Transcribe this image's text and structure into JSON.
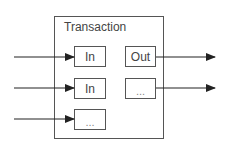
{
  "diagram": {
    "title": "Transaction",
    "inputs": [
      {
        "label": "In"
      },
      {
        "label": "In"
      },
      {
        "label": "..."
      }
    ],
    "outputs": [
      {
        "label": "Out"
      },
      {
        "label": "..."
      }
    ],
    "colors": {
      "stroke": "#555555",
      "arrow": "#222222",
      "background": "#ffffff"
    }
  }
}
